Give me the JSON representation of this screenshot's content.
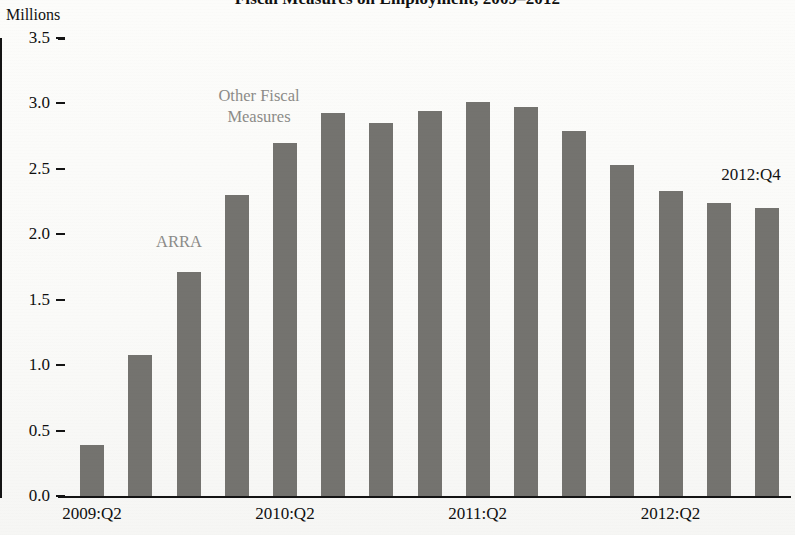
{
  "chart_data": {
    "type": "bar",
    "title": "Fiscal Measures on Employment, 2009–2012",
    "ylabel": "Millions",
    "xlabel": "",
    "ylim": [
      0.0,
      3.5
    ],
    "ytick_labels": [
      "3.5",
      "3.0",
      "2.5",
      "2.0",
      "1.5",
      "1.0",
      "0.5",
      "0.0"
    ],
    "ytick_values": [
      3.5,
      3.0,
      2.5,
      2.0,
      1.5,
      1.0,
      0.5,
      0.0
    ],
    "grid": false,
    "legend_position": "none",
    "bar_color": "#74736f",
    "axis_color": "#141414",
    "annotation_color": "#8c8b88",
    "categories": [
      "2009:Q2",
      "2009:Q3",
      "2009:Q4",
      "2010:Q1",
      "2010:Q2",
      "2010:Q3",
      "2010:Q4",
      "2011:Q1",
      "2011:Q2",
      "2011:Q3",
      "2011:Q4",
      "2012:Q1",
      "2012:Q2",
      "2012:Q3",
      "2012:Q4"
    ],
    "values": [
      0.39,
      1.08,
      1.71,
      2.3,
      2.7,
      2.93,
      2.85,
      2.94,
      3.01,
      2.97,
      2.79,
      2.53,
      2.33,
      2.24,
      2.2
    ],
    "xtick_labels": [
      "2009:Q2",
      "2010:Q2",
      "2011:Q2",
      "2012:Q2"
    ],
    "xtick_indices": [
      0,
      4,
      8,
      12
    ],
    "annotations": [
      {
        "name": "arra",
        "text": "ARRA"
      },
      {
        "name": "other-fiscal-measures",
        "text": "Other Fiscal\nMeasures"
      },
      {
        "name": "last-quarter",
        "text": "2012:Q4"
      }
    ]
  },
  "labels": {
    "title": "Fiscal Measures on Employment, 2009–2012",
    "y_axis_caption": "Millions",
    "annotation_arra": "ARRA",
    "annotation_other_fiscal": "Other Fiscal\nMeasures",
    "annotation_2012q4": "2012:Q4"
  }
}
